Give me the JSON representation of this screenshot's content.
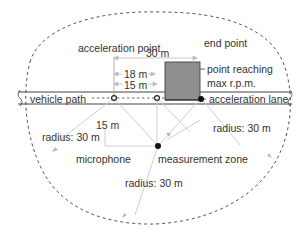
{
  "diagram": {
    "type": "vehicle acceleration noise measurement layout",
    "labels": {
      "acceleration_point": "acceleration point",
      "end_point": "end point",
      "dist_30": "30 m",
      "dist_18": "18 m",
      "dist_15_top": "15 m",
      "point_reaching_line1": "point reaching",
      "point_reaching_line2": "max r.p.m.",
      "vehicle_path": "vehicle path",
      "acceleration_lane": "acceleration lane",
      "dist_15_side": "15 m",
      "radius_left": "radius: 30 m",
      "radius_right": "radius: 30 m",
      "radius_bottom": "radius: 30 m",
      "microphone": "microphone",
      "measurement_zone": "measurement zone"
    },
    "colors": {
      "box_fill": "#8f8f8f",
      "box_stroke": "#333333",
      "road_line": "#444444",
      "boundary": "#555555",
      "dimension_lines": "#bbbbbb",
      "text": "#333333"
    }
  }
}
